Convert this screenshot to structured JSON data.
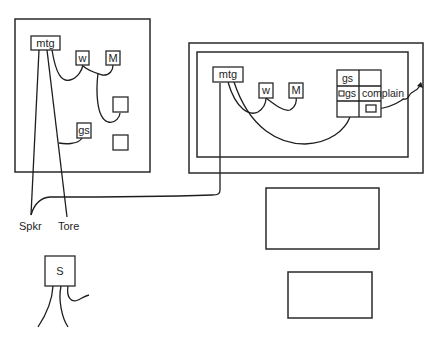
{
  "diagram": {
    "left_panel": {
      "nodes": {
        "mtg": "mtg",
        "w": "w",
        "M": "M",
        "gs": "gs"
      }
    },
    "right_panel": {
      "nodes": {
        "mtg": "mtg",
        "w": "w",
        "M": "M"
      },
      "grid": {
        "cells": [
          [
            "gs",
            ""
          ],
          [
            "gs",
            "complain"
          ],
          [
            "",
            ""
          ]
        ]
      }
    },
    "labels": {
      "spkr": "Spkr",
      "tore": "Tore"
    },
    "s_node": {
      "label": "S"
    }
  }
}
